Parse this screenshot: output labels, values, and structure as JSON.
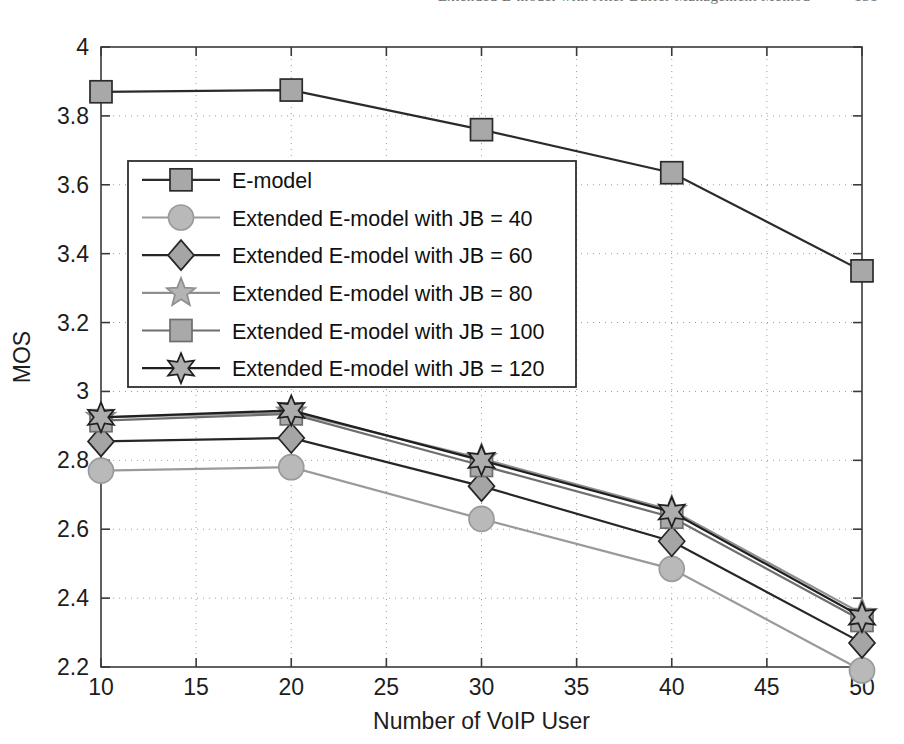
{
  "page_header": {
    "running_head": "Extended E-model with Jitter Buffer Management Method",
    "page_number": "131"
  },
  "figure": {
    "name": "mos-vs-voip-users-chart"
  },
  "chart_data": {
    "type": "line",
    "title": "",
    "xlabel": "Number of VoIP User",
    "ylabel": "MOS",
    "x": [
      10,
      20,
      30,
      40,
      50
    ],
    "xlim": [
      10,
      50
    ],
    "ylim": [
      2.2,
      4
    ],
    "xticks": [
      10,
      15,
      20,
      25,
      30,
      35,
      40,
      45,
      50
    ],
    "xtick_labels": [
      "10",
      "15",
      "20",
      "25",
      "30",
      "35",
      "40",
      "45",
      "50"
    ],
    "yticks": [
      2.2,
      2.4,
      2.6,
      2.8,
      3.0,
      3.2,
      3.4,
      3.6,
      3.8,
      4.0
    ],
    "ytick_labels": [
      "2.2",
      "2.4",
      "2.6",
      "2.8",
      "3",
      "3.2",
      "3.4",
      "3.6",
      "3.8",
      "4"
    ],
    "grid": "dotted",
    "legend_position": "upper-left-inside",
    "series": [
      {
        "name": "E-model",
        "marker": "square",
        "color": "#2b2b2b",
        "marker_fill": "#a8a8a8",
        "values": [
          3.87,
          3.875,
          3.76,
          3.635,
          3.35
        ]
      },
      {
        "name": "Extended E-model with JB = 40",
        "marker": "circle",
        "color": "#9a9a9a",
        "marker_fill": "#b9b9b9",
        "values": [
          2.77,
          2.78,
          2.63,
          2.485,
          2.19
        ]
      },
      {
        "name": "Extended E-model with JB = 60",
        "marker": "diamond",
        "color": "#262626",
        "marker_fill": "#a5a5a5",
        "values": [
          2.855,
          2.865,
          2.725,
          2.565,
          2.27
        ]
      },
      {
        "name": "Extended E-model with JB = 80",
        "marker": "star5",
        "color": "#8f8f8f",
        "marker_fill": "#b4b4b4",
        "values": [
          2.925,
          2.94,
          2.805,
          2.655,
          2.355
        ]
      },
      {
        "name": "Extended E-model with JB = 100",
        "marker": "square",
        "color": "#6e6e6e",
        "marker_fill": "#a9a9a9",
        "values": [
          2.915,
          2.935,
          2.785,
          2.635,
          2.335
        ]
      },
      {
        "name": "Extended E-model with JB = 120",
        "marker": "star6",
        "color": "#1f1f1f",
        "marker_fill": "#adadad",
        "values": [
          2.925,
          2.945,
          2.8,
          2.65,
          2.345
        ]
      }
    ]
  }
}
